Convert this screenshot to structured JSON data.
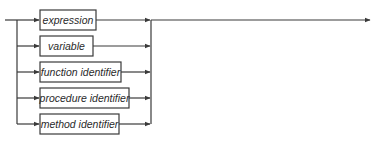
{
  "diagram": {
    "type": "syntax-diagram",
    "stroke_color": "#3a3a3a",
    "alternatives": [
      {
        "label": "expression"
      },
      {
        "label": "variable"
      },
      {
        "label": "function identifier"
      },
      {
        "label": "procedure identifier"
      },
      {
        "label": "method identifier"
      }
    ]
  }
}
